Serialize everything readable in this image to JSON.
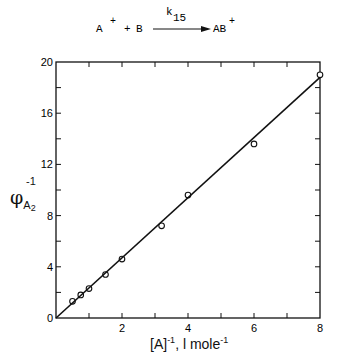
{
  "reaction": {
    "reactant1": "A",
    "reactant1_charge": "+",
    "plus": "+",
    "reactant2": "B",
    "rate_constant": "k",
    "rate_constant_sub": "15",
    "product": "AB",
    "product_charge": "+"
  },
  "chart_data": {
    "type": "scatter",
    "title": "",
    "xlabel": "[A]⁻¹, l mole⁻¹",
    "ylabel": "φ⁻¹ A2",
    "xlim": [
      0,
      8
    ],
    "ylim": [
      0,
      20
    ],
    "x_ticks": [
      0,
      2,
      4,
      6,
      8
    ],
    "x_tick_labels": [
      "",
      "2",
      "4",
      "6",
      "8"
    ],
    "x_minor_ticks": [
      1,
      3,
      5,
      7
    ],
    "y_ticks": [
      0,
      4,
      8,
      12,
      16,
      20
    ],
    "y_tick_labels": [
      "0",
      "4",
      "8",
      "12",
      "16",
      "20"
    ],
    "y_minor_ticks": [
      2,
      6,
      10,
      14,
      18
    ],
    "grid": false,
    "legend": null,
    "series": [
      {
        "name": "data",
        "marker": "open-circle",
        "x": [
          0.5,
          0.75,
          1.0,
          1.5,
          2.0,
          3.2,
          4.0,
          6.0,
          8.0
        ],
        "y": [
          1.3,
          1.8,
          2.3,
          3.4,
          4.6,
          7.2,
          9.6,
          13.6,
          19.0
        ]
      },
      {
        "name": "fit",
        "style": "line",
        "x": [
          0,
          8
        ],
        "y": [
          0,
          18.8
        ]
      }
    ]
  },
  "labels": {
    "y_axis_phi": "φ",
    "y_axis_sub": "A",
    "y_axis_subsub": "2",
    "y_axis_sup": "-1",
    "x_axis_main": "[A]",
    "x_axis_sup1": "-1",
    "x_axis_unit": ", l mole",
    "x_axis_sup2": "-1",
    "origin": "0"
  }
}
